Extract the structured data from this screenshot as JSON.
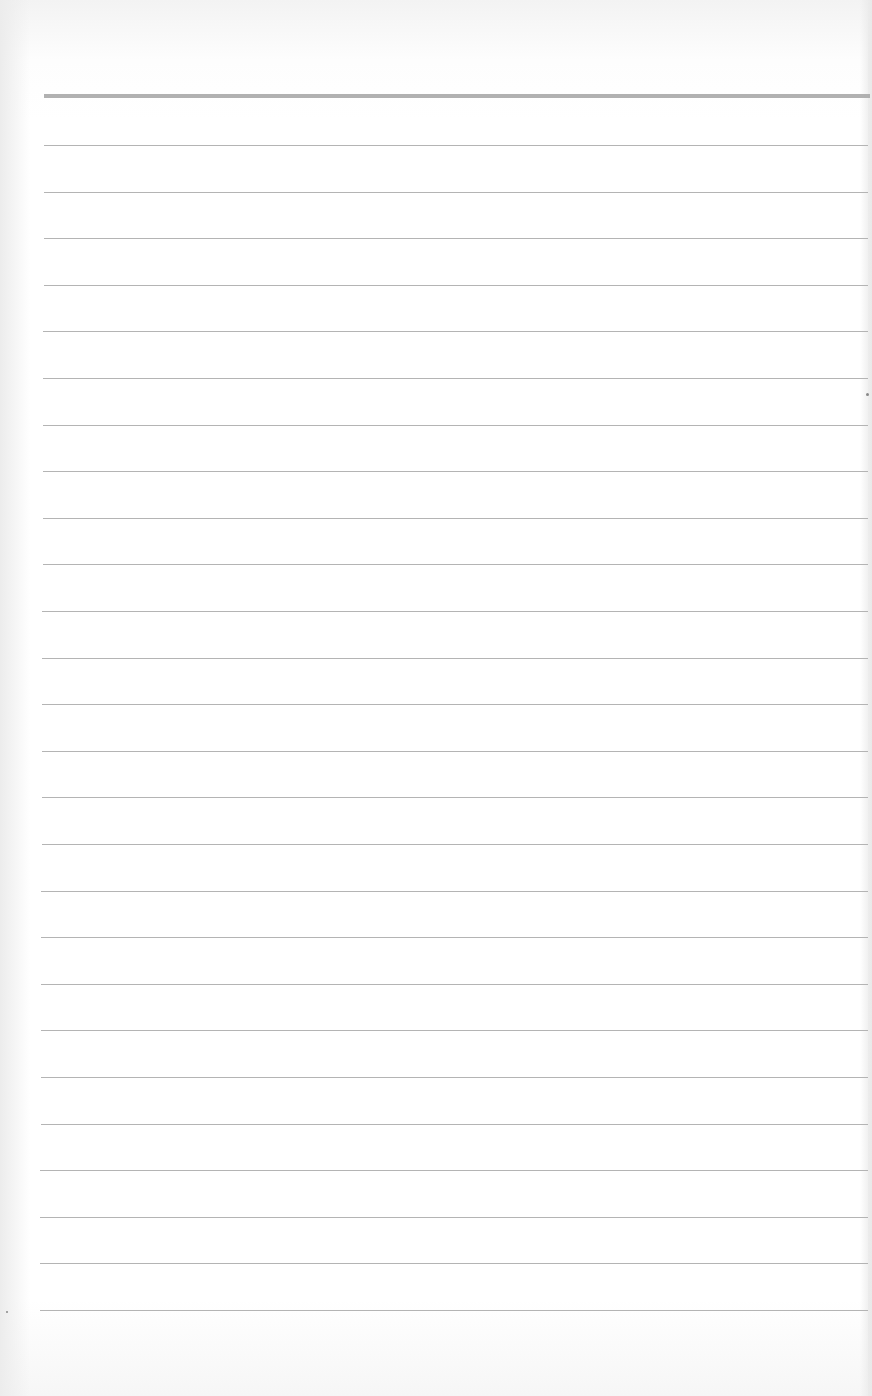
{
  "page": {
    "type": "blank ruled notebook paper",
    "header_rule": {
      "top": 94,
      "thickness": 4,
      "color": "#a9a9a9"
    },
    "ruled_lines": {
      "count": 26,
      "first_top": 145,
      "spacing": 46.6,
      "color": "#b4b4b4",
      "left_start_top": 44,
      "left_start_bottom": 40,
      "right_end": 868
    },
    "background_color": "#f4f4f4",
    "paper_color": "#ffffff",
    "text_content": []
  }
}
